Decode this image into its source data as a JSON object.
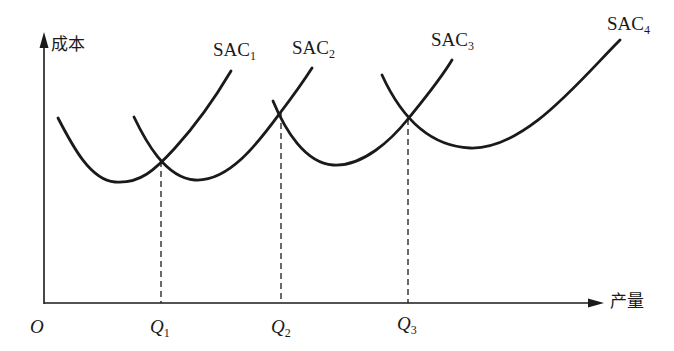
{
  "diagram": {
    "title_cutoff": "",
    "axes": {
      "y_label": "成本",
      "x_label": "产量",
      "origin_label": "O"
    },
    "curves": [
      {
        "name": "SAC",
        "sub": "1"
      },
      {
        "name": "SAC",
        "sub": "2"
      },
      {
        "name": "SAC",
        "sub": "3"
      },
      {
        "name": "SAC",
        "sub": "4"
      }
    ],
    "quantities": [
      {
        "name": "Q",
        "sub": "1"
      },
      {
        "name": "Q",
        "sub": "2"
      },
      {
        "name": "Q",
        "sub": "3"
      }
    ],
    "colors": {
      "line": "#1a1a1a",
      "background": "#ffffff"
    }
  }
}
